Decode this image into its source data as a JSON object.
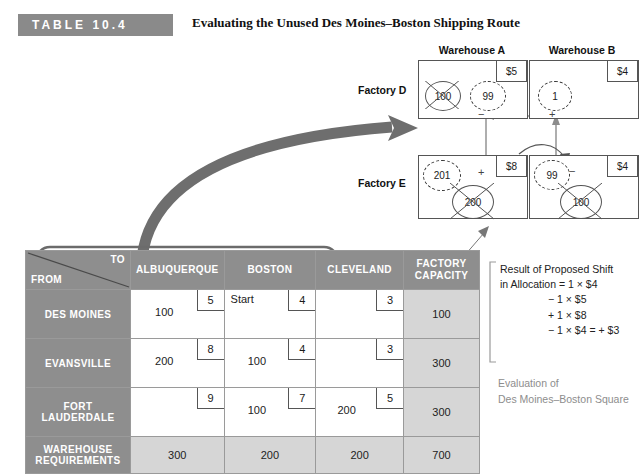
{
  "header": {
    "badge": "TABLE 10.4",
    "caption": "Evaluating the Unused Des Moines–Boston Shipping Route"
  },
  "diagram": {
    "warehouse_a_title": "Warehouse A",
    "warehouse_b_title": "Warehouse B",
    "factory_d_label": "Factory D",
    "factory_e_label": "Factory E",
    "cells": {
      "da": {
        "cost": "$5",
        "old_alloc": "100",
        "new_alloc": "99",
        "sign": "−"
      },
      "db": {
        "cost": "$4",
        "new_alloc": "1",
        "sign": "+"
      },
      "ea": {
        "cost": "$8",
        "old_alloc": "200",
        "new_alloc": "201",
        "sign": "+"
      },
      "eb": {
        "cost": "$4",
        "old_alloc": "100",
        "new_alloc": "99",
        "sign": "−"
      }
    }
  },
  "table": {
    "corner_to": "TO",
    "corner_from": "FROM",
    "columns": [
      "ALBUQUERQUE",
      "BOSTON",
      "CLEVELAND"
    ],
    "capacity_header_line1": "FACTORY",
    "capacity_header_line2": "CAPACITY",
    "req_header_line1": "WAREHOUSE",
    "req_header_line2": "REQUIREMENTS",
    "rows": [
      {
        "name": "DES MOINES",
        "capacity": "100",
        "cells": [
          {
            "cost": "5",
            "ship": "100",
            "note": ""
          },
          {
            "cost": "4",
            "ship": "",
            "note": "Start"
          },
          {
            "cost": "3",
            "ship": "",
            "note": ""
          }
        ]
      },
      {
        "name": "EVANSVILLE",
        "capacity": "300",
        "cells": [
          {
            "cost": "8",
            "ship": "200",
            "note": ""
          },
          {
            "cost": "4",
            "ship": "100",
            "note": ""
          },
          {
            "cost": "3",
            "ship": "",
            "note": ""
          }
        ]
      },
      {
        "name": "FORT LAUDERDALE",
        "capacity": "300",
        "cells": [
          {
            "cost": "9",
            "ship": "",
            "note": ""
          },
          {
            "cost": "7",
            "ship": "100",
            "note": ""
          },
          {
            "cost": "5",
            "ship": "200",
            "note": ""
          }
        ]
      }
    ],
    "requirements": [
      "300",
      "200",
      "200"
    ],
    "total": "700"
  },
  "notes": {
    "result_line1": "Result of Proposed Shift",
    "result_line2": "in Allocation = 1 × $4",
    "result_line3": "− 1 × $5",
    "result_line4": "+ 1 × $8",
    "result_line5": "− 1 × $4 = + $3",
    "eval_line1": "Evaluation of",
    "eval_line2": "Des Moines–Boston Square"
  },
  "colors": {
    "badge_gray": "#8a8a8a",
    "header_gray": "#8e8e8e",
    "shade_gray": "#d6d6d6",
    "arrow_gray": "#6e6e6e"
  }
}
